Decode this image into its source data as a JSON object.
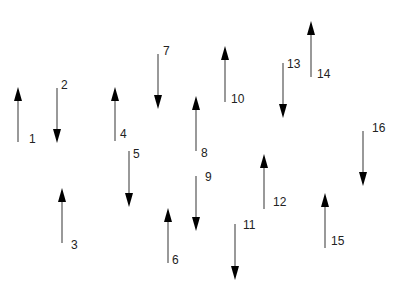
{
  "diagram": {
    "title": "",
    "colors": {
      "shaft": "#555555",
      "head": "#000000",
      "label": "#222222"
    },
    "arrows": [
      {
        "id": "1",
        "x": 18,
        "y1": 142,
        "y2": 87,
        "dir": "up",
        "label": "1",
        "lx": 29,
        "ly": 133
      },
      {
        "id": "2",
        "x": 57,
        "y1": 88,
        "y2": 143,
        "dir": "down",
        "label": "2",
        "lx": 61,
        "ly": 79
      },
      {
        "id": "3",
        "x": 62,
        "y1": 243,
        "y2": 188,
        "dir": "up",
        "label": "3",
        "lx": 71,
        "ly": 239
      },
      {
        "id": "4",
        "x": 115,
        "y1": 141,
        "y2": 87,
        "dir": "up",
        "label": "4",
        "lx": 120,
        "ly": 128
      },
      {
        "id": "5",
        "x": 129,
        "y1": 151,
        "y2": 207,
        "dir": "down",
        "label": "5",
        "lx": 133,
        "ly": 148
      },
      {
        "id": "6",
        "x": 168,
        "y1": 263,
        "y2": 208,
        "dir": "up",
        "label": "6",
        "lx": 172,
        "ly": 254
      },
      {
        "id": "7",
        "x": 158,
        "y1": 54,
        "y2": 109,
        "dir": "down",
        "label": "7",
        "lx": 163,
        "ly": 45
      },
      {
        "id": "8",
        "x": 196,
        "y1": 151,
        "y2": 96,
        "dir": "up",
        "label": "8",
        "lx": 201,
        "ly": 147
      },
      {
        "id": "9",
        "x": 196,
        "y1": 176,
        "y2": 231,
        "dir": "down",
        "label": "9",
        "lx": 205,
        "ly": 171
      },
      {
        "id": "10",
        "x": 225,
        "y1": 102,
        "y2": 46,
        "dir": "up",
        "label": "10",
        "lx": 231,
        "ly": 93
      },
      {
        "id": "11",
        "x": 235,
        "y1": 224,
        "y2": 280,
        "dir": "down",
        "label": "11",
        "lx": 243,
        "ly": 219
      },
      {
        "id": "12",
        "x": 264,
        "y1": 209,
        "y2": 154,
        "dir": "up",
        "label": "12",
        "lx": 273,
        "ly": 196
      },
      {
        "id": "13",
        "x": 283,
        "y1": 63,
        "y2": 118,
        "dir": "down",
        "label": "13",
        "lx": 287,
        "ly": 58
      },
      {
        "id": "14",
        "x": 311,
        "y1": 77,
        "y2": 21,
        "dir": "up",
        "label": "14",
        "lx": 317,
        "ly": 68
      },
      {
        "id": "15",
        "x": 325,
        "y1": 248,
        "y2": 193,
        "dir": "up",
        "label": "15",
        "lx": 331,
        "ly": 235
      },
      {
        "id": "16",
        "x": 363,
        "y1": 131,
        "y2": 186,
        "dir": "down",
        "label": "16",
        "lx": 372,
        "ly": 122
      }
    ]
  }
}
